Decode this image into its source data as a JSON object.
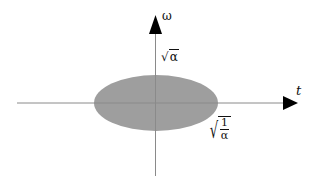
{
  "diagram": {
    "axes": {
      "horizontal_label": "t",
      "vertical_label": "ω"
    },
    "ellipse": {
      "fill_color": "#9e9e9e",
      "center": [
        156,
        103
      ],
      "rx": 62,
      "ry": 28
    },
    "annotations": {
      "vertical_extent": {
        "radical": "√",
        "argument": "α"
      },
      "horizontal_extent": {
        "radical": "√",
        "numerator": "1",
        "denominator": "α"
      }
    },
    "colors": {
      "axis": "#8a8a8a",
      "arrowhead": "#000000",
      "ellipse": "#9e9e9e"
    }
  }
}
